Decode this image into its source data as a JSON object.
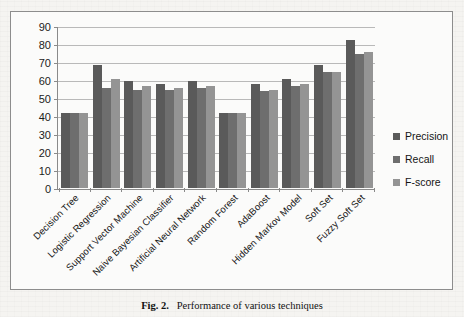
{
  "figure": {
    "caption_number": "Fig. 2.",
    "caption_text": "Performance of various techniques"
  },
  "chart_data": {
    "type": "bar",
    "title": "",
    "xlabel": "",
    "ylabel": "",
    "ylim": [
      0,
      90
    ],
    "ytick_step": 10,
    "yticks": [
      0,
      10,
      20,
      30,
      40,
      50,
      60,
      70,
      80,
      90
    ],
    "grid": true,
    "legend_position": "right",
    "categories": [
      "Decision Tree",
      "Logistic Regression",
      "Support Vector Machine",
      "Naive Bayesian Classifier",
      "Artificial Neural Network",
      "Random Forest",
      "AdaBoost",
      "Hidden Markov Model",
      "Soft Set",
      "Fuzzy Soft Set"
    ],
    "series": [
      {
        "name": "Precision",
        "color": "#5a5a5a",
        "values": [
          42,
          69,
          60,
          58,
          60,
          42,
          58,
          61,
          69,
          83
        ]
      },
      {
        "name": "Recall",
        "color": "#6e6e6e",
        "values": [
          42,
          56,
          55,
          55,
          56,
          42,
          54,
          57,
          65,
          75
        ]
      },
      {
        "name": "F-score",
        "color": "#949494",
        "values": [
          42,
          61,
          57,
          56,
          57,
          42,
          55,
          58,
          65,
          76
        ]
      }
    ]
  }
}
